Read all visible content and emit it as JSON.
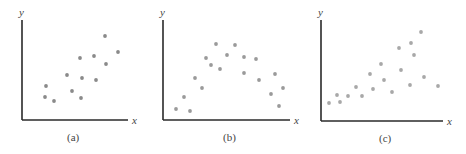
{
  "figure": {
    "panels": [
      {
        "caption": "(a)",
        "xlabel": "x",
        "ylabel": "y"
      },
      {
        "caption": "(b)",
        "xlabel": "x",
        "ylabel": "y"
      },
      {
        "caption": "(c)",
        "xlabel": "x",
        "ylabel": "y"
      }
    ]
  },
  "chart_data": [
    {
      "type": "scatter",
      "title": "(a)",
      "xlabel": "x",
      "ylabel": "y",
      "grid": false,
      "description": "Positive linear relationship, moderate spread",
      "point_color": "#8a8a8a",
      "axes_px": {
        "origin": [
          22,
          120
        ],
        "x_end": 128,
        "y_top": 20
      },
      "points_px": [
        [
          105,
          36
        ],
        [
          118,
          52
        ],
        [
          80,
          58
        ],
        [
          94,
          56
        ],
        [
          106,
          64
        ],
        [
          67,
          75
        ],
        [
          82,
          78
        ],
        [
          96,
          80
        ],
        [
          46,
          86
        ],
        [
          72,
          91
        ],
        [
          45,
          97
        ],
        [
          54,
          101
        ],
        [
          81,
          98
        ]
      ]
    },
    {
      "type": "scatter",
      "title": "(b)",
      "xlabel": "x",
      "ylabel": "y",
      "grid": false,
      "description": "Curvilinear (inverted-U) relationship",
      "point_color": "#9a9a9a",
      "axes_px": {
        "origin": [
          163,
          120
        ],
        "x_end": 290,
        "y_top": 20
      },
      "points_px": [
        [
          216,
          44
        ],
        [
          235,
          45
        ],
        [
          227,
          55
        ],
        [
          244,
          57
        ],
        [
          256,
          59
        ],
        [
          206,
          58
        ],
        [
          211,
          65
        ],
        [
          220,
          69
        ],
        [
          244,
          73
        ],
        [
          275,
          74
        ],
        [
          195,
          78
        ],
        [
          259,
          80
        ],
        [
          202,
          88
        ],
        [
          283,
          88
        ],
        [
          271,
          94
        ],
        [
          184,
          97
        ],
        [
          279,
          106
        ],
        [
          176,
          109
        ],
        [
          190,
          111
        ]
      ]
    },
    {
      "type": "scatter",
      "title": "(c)",
      "xlabel": "x",
      "ylabel": "y",
      "grid": false,
      "description": "Positive relationship with increasing variance (fan shape)",
      "point_color": "#a8a8a8",
      "axes_px": {
        "origin": [
          321,
          121
        ],
        "x_end": 443,
        "y_top": 20
      },
      "points_px": [
        [
          421,
          32
        ],
        [
          411,
          43
        ],
        [
          399,
          48
        ],
        [
          414,
          55
        ],
        [
          381,
          64
        ],
        [
          401,
          70
        ],
        [
          370,
          74
        ],
        [
          384,
          80
        ],
        [
          424,
          77
        ],
        [
          410,
          85
        ],
        [
          438,
          86
        ],
        [
          356,
          87
        ],
        [
          373,
          89
        ],
        [
          392,
          92
        ],
        [
          337,
          95
        ],
        [
          348,
          96
        ],
        [
          362,
          96
        ],
        [
          329,
          103
        ],
        [
          340,
          102
        ]
      ]
    }
  ]
}
